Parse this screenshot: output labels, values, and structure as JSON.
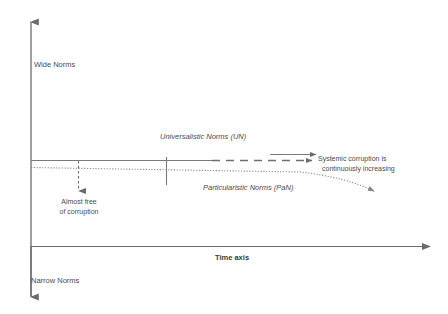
{
  "diagram": {
    "axes": {
      "vertical_top_label": "Wide Norms",
      "vertical_bottom_label": "Narrow  Norms",
      "horizontal_label": "Time axis"
    },
    "labels": {
      "universalistic": "Universalistic Norms (UN)",
      "particularistic": "Particularistic Norms (PaN)",
      "systemic_line1": "Systemic corruption is",
      "systemic_line2": "continuously increasing",
      "almost_free_line1": "Almost free",
      "almost_free_line2": "of corruption"
    },
    "colors": {
      "axis": "#6b6b6b",
      "line": "#7a7a7a",
      "text": "#4a4a4a",
      "background": "#ffffff"
    }
  }
}
